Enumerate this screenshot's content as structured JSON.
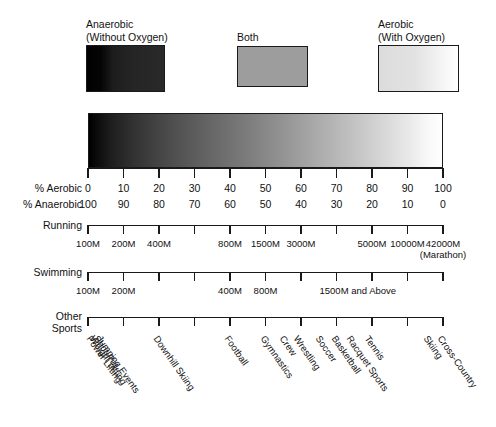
{
  "chart_data": {
    "type": "heatmap",
    "grid": false,
    "legend_position": "top",
    "legend": [
      {
        "name": "legend-anaerobic",
        "line1": "Anaerobic",
        "line2": "(Without Oxygen)",
        "shade": "black"
      },
      {
        "name": "legend-both",
        "line1": "Both",
        "line2": "",
        "shade": "mid-gray"
      },
      {
        "name": "legend-aerobic",
        "line1": "Aerobic",
        "line2": "(With Oxygen)",
        "shade": "light-gray"
      }
    ],
    "gradient": {
      "from": "#000000",
      "to": "#ffffff",
      "left_meaning": "100% Anaerobic",
      "right_meaning": "100% Aerobic"
    },
    "axis": {
      "range": [
        0,
        100
      ],
      "tick_count": 11
    },
    "rows": [
      {
        "name": "percent-aerobic",
        "label": "% Aerobic",
        "values": [
          "0",
          "10",
          "20",
          "30",
          "40",
          "50",
          "60",
          "70",
          "80",
          "90",
          "100"
        ]
      },
      {
        "name": "percent-anaerobic",
        "label": "% Anaerobic",
        "values": [
          "100",
          "90",
          "80",
          "70",
          "60",
          "50",
          "40",
          "30",
          "20",
          "10",
          "0"
        ]
      }
    ],
    "running": {
      "label": "Running",
      "tick_count": 11,
      "marks": [
        {
          "text": "100M",
          "tick": 0
        },
        {
          "text": "200M",
          "tick": 1
        },
        {
          "text": "400M",
          "tick": 2
        },
        {
          "text": "800M",
          "tick": 4
        },
        {
          "text": "1500M",
          "tick": 5
        },
        {
          "text": "3000M",
          "tick": 6
        },
        {
          "text": "5000M",
          "tick": 8
        },
        {
          "text": "10000M",
          "tick": 9
        },
        {
          "text": "42000M",
          "tick": 10,
          "sub": "(Marathon)"
        }
      ]
    },
    "swimming": {
      "label": "Swimming",
      "tick_count": 11,
      "marks": [
        {
          "text": "100M",
          "tick": 0
        },
        {
          "text": "200M",
          "tick": 1
        },
        {
          "text": "400M",
          "tick": 4
        },
        {
          "text": "800M",
          "tick": 5
        },
        {
          "text": "1500M and Above",
          "tick": 7.6
        }
      ]
    },
    "other_sports": {
      "label_line1": "Other",
      "label_line2": "Sports",
      "tick_count": 11,
      "marks": [
        {
          "text": "Jumping Events",
          "pos": 0.4
        },
        {
          "text": "Shot Put",
          "pos": 0.3
        },
        {
          "text": "Weight Lifting",
          "pos": 0.2
        },
        {
          "text": "Power Lifting",
          "pos": 0.1
        },
        {
          "text": "Downhill Skiing",
          "pos": 2.0
        },
        {
          "text": "Football",
          "pos": 4.0
        },
        {
          "text": "Gymnastics",
          "pos": 5.0
        },
        {
          "text": "Crew",
          "pos": 5.55
        },
        {
          "text": "Wrestling",
          "pos": 5.95
        },
        {
          "text": "Soccer",
          "pos": 6.55
        },
        {
          "text": "Basketball",
          "pos": 7.0
        },
        {
          "text": "Racquet Sports",
          "pos": 7.45
        },
        {
          "text": "Tennis",
          "pos": 7.95
        },
        {
          "text": "Cross-Country",
          "pos": 10.0
        },
        {
          "text": "Skiing",
          "pos": 9.6
        }
      ]
    }
  }
}
